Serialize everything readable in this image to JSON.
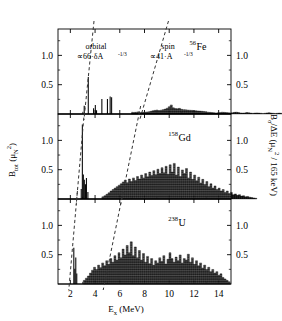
{
  "figure": {
    "xlabel_main": "E",
    "xlabel_sub": "x",
    "xlabel_unit": "(MeV)",
    "ylabel_left_main": "B",
    "ylabel_left_sub": "tot",
    "ylabel_left_unit_open": "(",
    "ylabel_left_mu": "μ",
    "ylabel_left_mu_sub": "N",
    "ylabel_left_mu_sup": "2",
    "ylabel_left_unit_close": ")",
    "ylabel_right_main": "B",
    "ylabel_right_sub": "σ",
    "ylabel_right_div": "/ΔE",
    "ylabel_right_unit": "(μ",
    "ylabel_right_unit_sub": "N",
    "ylabel_right_unit_sup": "2",
    "ylabel_right_unit_rest": "/ 165 keV)",
    "axis_color": "#000000",
    "data_color": "#000000",
    "guide_color": "#333333"
  },
  "annotations": {
    "orbital": {
      "title": "orbital",
      "formula_pre": "∝66·δA",
      "formula_exp": "-1/3"
    },
    "spin": {
      "title": "spin",
      "formula_pre": "∝41·A",
      "formula_exp": "-1/3"
    }
  },
  "chart_data": {
    "type": "bar",
    "title": "",
    "xlabel": "E_x (MeV)",
    "ylabel": "B_tot (μ_N^2)",
    "ylabel_right": "B_σ/ΔE (μ_N^2 / 165 keV)",
    "xlim": [
      1.0,
      15.0
    ],
    "xticks": [
      2,
      4,
      6,
      8,
      10,
      12,
      14
    ],
    "xticklabels": [
      "2",
      "4",
      "6",
      "8",
      "10",
      "12",
      "14"
    ],
    "grid": false,
    "legend": false,
    "panels": [
      {
        "nucleus_mass": "56",
        "nucleus_symbol": "Fe",
        "label": "56Fe",
        "ylim": [
          0,
          1.45
        ],
        "yticks": [
          0.5,
          1.0
        ],
        "yticklabels": [
          "0.5",
          "1.0"
        ],
        "bin_width": 0.165,
        "discrete_lines": [
          {
            "x": 3.12,
            "y": 0.14
          },
          {
            "x": 3.45,
            "y": 0.63
          },
          {
            "x": 3.88,
            "y": 0.1
          },
          {
            "x": 4.02,
            "y": 0.155
          },
          {
            "x": 4.12,
            "y": 0.065
          },
          {
            "x": 4.55,
            "y": 0.255
          },
          {
            "x": 5.0,
            "y": 0.255
          },
          {
            "x": 5.22,
            "y": 0.3
          },
          {
            "x": 5.34,
            "y": 0.285
          }
        ],
        "histogram": {
          "x_start": 6.95,
          "bin_width": 0.165,
          "values": [
            0.035,
            0.045,
            0.05,
            0.06,
            0.04,
            0.045,
            0.05,
            0.055,
            0.06,
            0.075,
            0.09,
            0.1,
            0.11,
            0.095,
            0.105,
            0.12,
            0.135,
            0.16,
            0.2,
            0.25,
            0.17,
            0.15,
            0.145,
            0.155,
            0.13,
            0.12,
            0.115,
            0.11,
            0.105,
            0.1,
            0.095,
            0.09,
            0.085,
            0.08,
            0.075,
            0.07,
            0.06,
            0.05,
            0.045,
            0.04,
            0.035,
            0.03,
            0.035,
            0.04,
            0.05,
            0.045,
            0.04,
            0.035,
            0.03,
            0.035,
            0.045,
            0.05,
            0.04,
            0.03,
            0.025,
            0.03,
            0.04,
            0.035,
            0.025,
            0.02,
            0.025,
            0.03,
            0.025,
            0.02,
            0.015,
            0.02,
            0.03,
            0.035,
            0.025,
            0.02,
            0.015,
            0.02,
            0.025,
            0.02,
            0.015,
            0.01,
            0.015,
            0.02,
            0.015,
            0.01
          ]
        }
      },
      {
        "nucleus_mass": "158",
        "nucleus_symbol": "Gd",
        "label": "158Gd",
        "ylim": [
          0,
          1.45
        ],
        "yticks": [
          0.5,
          1.0
        ],
        "yticklabels": [
          "0.5",
          "1.0"
        ],
        "bin_width": 0.165,
        "discrete_lines": [
          {
            "x": 2.88,
            "y": 0.17
          },
          {
            "x": 2.97,
            "y": 1.27
          },
          {
            "x": 3.05,
            "y": 0.42
          },
          {
            "x": 3.13,
            "y": 0.33
          },
          {
            "x": 3.22,
            "y": 0.25
          },
          {
            "x": 3.3,
            "y": 0.36
          },
          {
            "x": 3.42,
            "y": 0.12
          }
        ],
        "histogram": {
          "x_start": 4.55,
          "bin_width": 0.165,
          "values": [
            0.06,
            0.09,
            0.13,
            0.17,
            0.22,
            0.26,
            0.3,
            0.34,
            0.38,
            0.42,
            0.47,
            0.52,
            0.45,
            0.55,
            0.48,
            0.58,
            0.51,
            0.62,
            0.55,
            0.66,
            0.58,
            0.7,
            0.61,
            0.74,
            0.65,
            0.78,
            0.67,
            0.82,
            0.7,
            0.86,
            0.72,
            0.9,
            0.68,
            0.94,
            0.74,
            0.98,
            0.66,
            0.88,
            0.62,
            0.8,
            0.7,
            0.84,
            0.58,
            0.74,
            0.54,
            0.66,
            0.5,
            0.6,
            0.44,
            0.54,
            0.4,
            0.48,
            0.34,
            0.42,
            0.3,
            0.36,
            0.26,
            0.3,
            0.22,
            0.26,
            0.18,
            0.22,
            0.15,
            0.18,
            0.12,
            0.14,
            0.1,
            0.12,
            0.08,
            0.09,
            0.06,
            0.07,
            0.05,
            0.04,
            0.03,
            0.02
          ]
        }
      },
      {
        "nucleus_mass": "238",
        "nucleus_symbol": "U",
        "label": "238U",
        "ylim": [
          0,
          1.45
        ],
        "yticks": [
          0.5,
          1.0
        ],
        "yticklabels": [
          "0.5",
          "1.0"
        ],
        "bin_width": 0.165,
        "discrete_lines": [
          {
            "x": 2.28,
            "y": 0.62
          },
          {
            "x": 2.36,
            "y": 0.26
          },
          {
            "x": 2.44,
            "y": 0.45
          },
          {
            "x": 2.52,
            "y": 0.18
          }
        ],
        "histogram": {
          "x_start": 3.05,
          "bin_width": 0.165,
          "values": [
            0.1,
            0.16,
            0.22,
            0.3,
            0.38,
            0.46,
            0.4,
            0.52,
            0.45,
            0.58,
            0.5,
            0.64,
            0.54,
            0.7,
            0.6,
            0.78,
            0.66,
            0.86,
            0.72,
            0.96,
            0.8,
            1.06,
            0.86,
            1.16,
            0.78,
            1.02,
            0.72,
            0.92,
            0.66,
            0.84,
            0.6,
            0.76,
            0.56,
            0.7,
            0.52,
            0.64,
            0.58,
            0.72,
            0.62,
            0.78,
            0.55,
            0.68,
            0.86,
            0.7,
            0.6,
            0.74,
            0.64,
            0.8,
            0.58,
            0.7,
            0.66,
            0.82,
            0.6,
            0.72,
            0.54,
            0.64,
            0.5,
            0.58,
            0.44,
            0.52,
            0.4,
            0.46,
            0.34,
            0.4,
            0.3,
            0.34,
            0.24,
            0.28,
            0.18,
            0.14,
            0.1,
            0.06
          ]
        }
      }
    ],
    "guide_lines": [
      {
        "name": "orbital",
        "points": [
          {
            "panel": 0,
            "x": 3.62
          },
          {
            "panel": 1,
            "x": 2.92
          },
          {
            "panel": 2,
            "x": 2.32
          }
        ]
      },
      {
        "name": "spin",
        "points": [
          {
            "panel": 0,
            "x": 9.1
          },
          {
            "panel": 1,
            "x": 7.1
          },
          {
            "panel": 2,
            "x": 5.7
          }
        ]
      }
    ]
  }
}
